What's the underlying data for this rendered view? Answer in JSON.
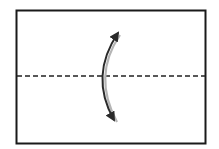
{
  "diagram": {
    "type": "fold-instruction",
    "paper": {
      "x": 16,
      "y": 10,
      "width": 189,
      "height": 133,
      "stroke": "#1a1a1a",
      "fill": "#ffffff"
    },
    "fold_line": {
      "style": "dashed",
      "y": 76,
      "x1": 16,
      "x2": 205,
      "stroke": "#222222",
      "dash": "5 3"
    },
    "arrow": {
      "kind": "curved-double-arrow",
      "from": [
        118,
        33
      ],
      "to": [
        114,
        120
      ],
      "bulge_x": 101,
      "stroke": "#2a2a2a",
      "shadow": "#b0b0b0"
    },
    "labels": {
      "fold_line": "valley fold line",
      "arrow": "fold direction arrow"
    }
  }
}
